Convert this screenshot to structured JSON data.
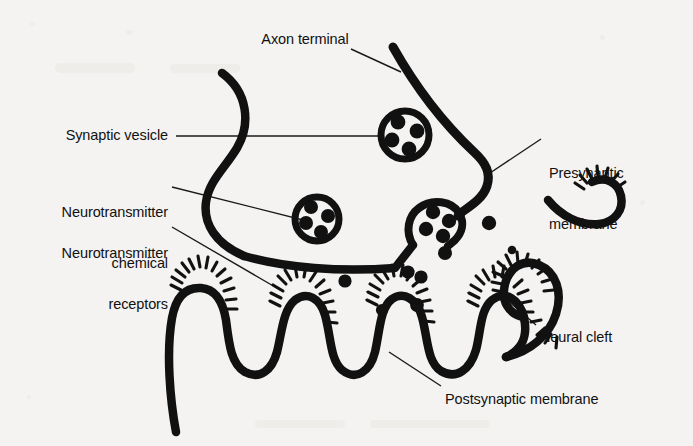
{
  "figure": {
    "background_color": "#f4f3f1",
    "ink_color": "#111111"
  },
  "labels": {
    "axon_terminal": "Axon terminal",
    "synaptic_vesicle": "Synaptic vesicle",
    "neurotransmitter_chemical_line1": "Neurotransmitter",
    "neurotransmitter_chemical_line2": "chemical",
    "neurotransmitter_receptors_line1": "Neurotransmitter",
    "neurotransmitter_receptors_line2": "receptors",
    "presynaptic_membrane_line1": "Presynaptic",
    "presynaptic_membrane_line2": "membrane",
    "neural_cleft": "Neural cleft",
    "postsynaptic_membrane": "Postsynaptic membrane"
  },
  "diagram_data": {
    "type": "diagram",
    "subject": "chemical synapse",
    "structures": [
      "axon terminal",
      "synaptic vesicles",
      "neurotransmitter chemical",
      "neurotransmitter receptors",
      "presynaptic membrane",
      "neural cleft",
      "postsynaptic membrane"
    ],
    "vesicle_count": 3,
    "vesicles": [
      {
        "name": "vesicle-upper",
        "cx": 405,
        "cy": 135,
        "r": 25,
        "granules": 4,
        "state": "free"
      },
      {
        "name": "vesicle-middle",
        "cx": 317,
        "cy": 219,
        "r": 23,
        "granules": 4,
        "state": "free"
      },
      {
        "name": "vesicle-docked",
        "cx": 437,
        "cy": 227,
        "r": 23,
        "granules": 4,
        "state": "fusing-with-presynaptic-membrane"
      }
    ],
    "granules_per_vesicle": 4,
    "free_neurotransmitter_dots": 8,
    "postsynaptic_folds": 4,
    "receptor_spike_clusters": 7
  }
}
